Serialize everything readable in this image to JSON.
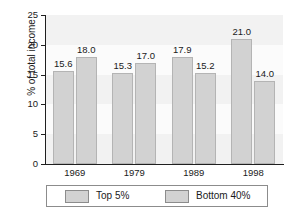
{
  "chart_data": {
    "type": "bar",
    "title": "",
    "xlabel": "",
    "ylabel": "% of total income",
    "categories": [
      "1969",
      "1979",
      "1989",
      "1998"
    ],
    "series": [
      {
        "name": "Top 5%",
        "values": [
          15.6,
          15.3,
          17.9,
          21.0
        ],
        "color": "#d2d2d2"
      },
      {
        "name": "Bottom 40%",
        "values": [
          18.0,
          17.0,
          15.2,
          14.0
        ],
        "color": "#d2d2d2"
      }
    ],
    "value_labels": [
      [
        "15.6",
        "15.3",
        "17.9",
        "21.0"
      ],
      [
        "18.0",
        "17.0",
        "15.2",
        "14.0"
      ]
    ],
    "ylim": [
      0,
      25
    ],
    "yticks": [
      0,
      5,
      10,
      15,
      20,
      25
    ],
    "ytick_labels": [
      "0",
      "5",
      "10",
      "15",
      "20",
      "25"
    ],
    "grid": true,
    "legend_position": "bottom",
    "bar_color": "#d2d2d2",
    "bar_edge_color": "#b4b4b4",
    "plot_background": "#fbfbfb",
    "grid_color": "#f2f2f2",
    "axis_color": "#1f1f1f",
    "text_color": "#1a1a1a"
  }
}
